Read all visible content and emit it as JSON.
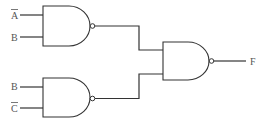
{
  "diagram": {
    "type": "logic-circuit",
    "inputs": [
      {
        "label": "A",
        "inverted": true,
        "gate": "nand-1"
      },
      {
        "label": "B",
        "inverted": false,
        "gate": "nand-1"
      },
      {
        "label": "B",
        "inverted": false,
        "gate": "nand-2"
      },
      {
        "label": "C",
        "inverted": true,
        "gate": "nand-2"
      }
    ],
    "gates": [
      {
        "id": "nand-1",
        "type": "NAND",
        "inputs": [
          "A̅",
          "B"
        ]
      },
      {
        "id": "nand-2",
        "type": "NAND",
        "inputs": [
          "B",
          "C̅"
        ]
      },
      {
        "id": "nand-3",
        "type": "NAND",
        "inputs": [
          "nand-1",
          "nand-2"
        ]
      }
    ],
    "output": {
      "label": "F",
      "gate": "nand-3"
    },
    "colors": {
      "line": "#333333",
      "text": "#555555",
      "background": "#ffffff"
    }
  },
  "labels": {
    "in_a": "A",
    "in_b1": "B",
    "in_b2": "B",
    "in_c": "C",
    "out_f": "F"
  }
}
